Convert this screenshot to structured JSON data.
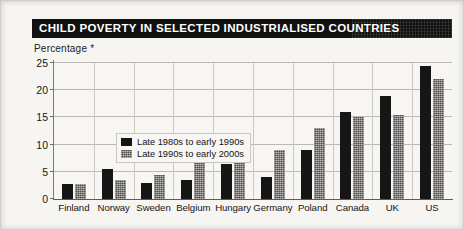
{
  "figure": {
    "title": "CHILD POVERTY IN SELECTED INDUSTRIALISED COUNTRIES",
    "axis_caption": "Percentage *",
    "title_band_color": "#111111",
    "title_text_color": "#ffffff",
    "paper_color": "#f6f5f2"
  },
  "legend": {
    "items": [
      {
        "label": "Late 1980s to early 1990s",
        "color": "#161616"
      },
      {
        "label": "Late 1990s to early 2000s",
        "color": "#4e4c48"
      }
    ]
  },
  "chart_data": {
    "type": "bar",
    "title": "CHILD POVERTY IN SELECTED INDUSTRIALISED COUNTRIES",
    "subtitle": "",
    "xlabel": "",
    "ylabel": "Percentage *",
    "ylim": [
      0,
      25
    ],
    "yticks": [
      0,
      5,
      10,
      15,
      20,
      25
    ],
    "ytick_labels": [
      "0",
      "5",
      "10",
      "15",
      "20",
      "25"
    ],
    "grid": true,
    "legend_position": "upper-left",
    "categories": [
      "Finland",
      "Norway",
      "Sweden",
      "Belgium",
      "Hungary",
      "Germany",
      "Poland",
      "Canada",
      "UK",
      "US"
    ],
    "series": [
      {
        "name": "Late 1980s to early 1990s",
        "color": "#161616",
        "values": [
          2.8,
          5.5,
          3.0,
          3.5,
          6.5,
          4.0,
          9.0,
          16.0,
          19.0,
          24.5
        ]
      },
      {
        "name": "Late 1990s to early 2000s",
        "color": "#4e4c48",
        "values": [
          2.8,
          3.5,
          4.5,
          7.5,
          9.0,
          9.0,
          13.0,
          15.0,
          15.5,
          22.0
        ]
      }
    ],
    "annotations": [
      "Percentage *"
    ]
  }
}
